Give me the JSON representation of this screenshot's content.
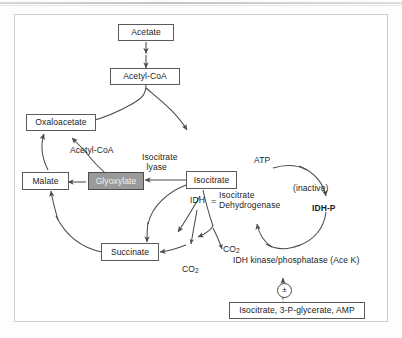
{
  "figure": {
    "frame_border_color": "#cccccc",
    "background_color": "#ffffff"
  },
  "metabolites": {
    "acetate": "Acetate",
    "acetyl_coa_top": "Acetyl-CoA",
    "oxaloacetate": "Oxaloacetate",
    "malate": "Malate",
    "glyoxylate": "Glyoxylate",
    "isocitrate": "Isocitrate",
    "succinate": "Succinate"
  },
  "cofactor_labels": {
    "acetyl_coa_entry": "Acetyl-CoA",
    "atp": "ATP",
    "co2_upper": "CO2",
    "co2_lower": "CO2"
  },
  "enzymes": {
    "isocitrate_lyase_line1": "Isocitrate",
    "isocitrate_lyase_line2": "lyase",
    "idh_abbrev": "IDH",
    "idh_equals": "=",
    "idh_full_line1": "Isocitrate",
    "idh_full_line2": "Dehydrogenase",
    "idh_kinase_phosphatase": "IDH kinase/phosphatase (Ace K)"
  },
  "regulation_cycle": {
    "inactive_label": "(inactive)",
    "idh_p_label": "IDH-P",
    "modulator_symbol": "±",
    "effectors_box": "Isocitrate, 3-P-glycerate, AMP"
  },
  "colors": {
    "stroke": "#4a4a4a",
    "box_border": "#5a5a5a",
    "shaded_fill": "#9a9a9a",
    "shaded_text": "#f2f2f2",
    "text": "#1a1a1a"
  }
}
